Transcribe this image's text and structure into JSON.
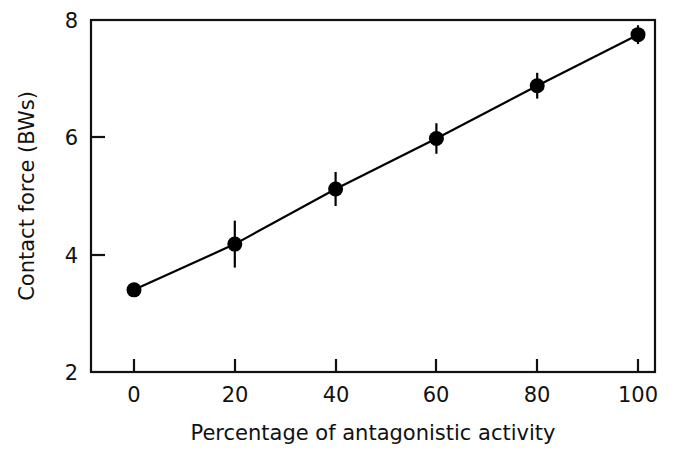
{
  "chart_data": {
    "type": "line",
    "title": "",
    "subtitle": "",
    "xlabel": "Percentage of antagonistic activity",
    "ylabel": "Contact force (BWs)",
    "xlim": [
      -6,
      106
    ],
    "ylim": [
      2,
      8
    ],
    "xticks": [
      0,
      20,
      40,
      60,
      80,
      100
    ],
    "xtick_labels": [
      "0",
      "20",
      "40",
      "60",
      "80",
      "100"
    ],
    "yticks": [
      2,
      4,
      6,
      8
    ],
    "ytick_labels": [
      "2",
      "4",
      "6",
      "8"
    ],
    "grid": false,
    "legend": false,
    "legend_position": "none",
    "marker": "filled-circle",
    "line_color": "#000000",
    "marker_color": "#000000",
    "x": [
      0,
      20,
      40,
      60,
      80,
      100
    ],
    "values": [
      3.4,
      4.18,
      5.12,
      5.98,
      6.88,
      7.75
    ],
    "error_bars": [
      0.0,
      0.4,
      0.29,
      0.26,
      0.22,
      0.16
    ],
    "series": [
      {
        "name": "Contact force",
        "x": [
          0,
          20,
          40,
          60,
          80,
          100
        ],
        "values": [
          3.4,
          4.18,
          5.12,
          5.98,
          6.88,
          7.75
        ],
        "error_bars": [
          0.0,
          0.4,
          0.29,
          0.26,
          0.22,
          0.16
        ]
      }
    ],
    "annotations": []
  },
  "axes": {
    "x_title": "Percentage of antagonistic activity",
    "y_title": "Contact force (BWs)",
    "x_tick_0": "0",
    "x_tick_1": "20",
    "x_tick_2": "40",
    "x_tick_3": "60",
    "x_tick_4": "80",
    "x_tick_5": "100",
    "y_tick_0": "2",
    "y_tick_1": "4",
    "y_tick_2": "6",
    "y_tick_3": "8"
  }
}
